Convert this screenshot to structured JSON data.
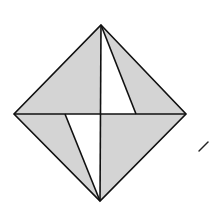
{
  "diagram": {
    "type": "geometric-figure",
    "colors": {
      "background": "#ffffff",
      "shade": "#d4d4d4",
      "stroke": "#111111",
      "white_region": "#ffffff"
    },
    "vertices": {
      "top": [
        101,
        25
      ],
      "left": [
        14,
        114
      ],
      "right": [
        186,
        114
      ],
      "bottom": [
        100,
        201
      ],
      "center": [
        101,
        114
      ],
      "upper_inner": [
        136,
        114
      ],
      "lower_inner": [
        65,
        114
      ]
    },
    "white_triangles": [
      {
        "name": "upper-white-triangle",
        "points": [
          [
            101,
            25
          ],
          [
            101,
            114
          ],
          [
            136,
            114
          ]
        ]
      },
      {
        "name": "lower-white-triangle",
        "points": [
          [
            65,
            114
          ],
          [
            101,
            114
          ],
          [
            100,
            201
          ]
        ]
      }
    ],
    "mark": {
      "name": "stray-stroke",
      "from": [
        199,
        151
      ],
      "to": [
        208,
        142
      ]
    }
  }
}
